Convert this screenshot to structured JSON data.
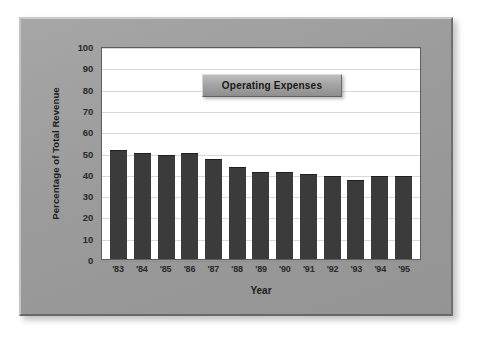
{
  "chart_data": {
    "type": "bar",
    "title": "Operating Expenses",
    "xlabel": "Year",
    "ylabel": "Percentage of Total Revenue",
    "categories": [
      "'83",
      "'84",
      "'85",
      "'86",
      "'87",
      "'88",
      "'89",
      "'90",
      "'91",
      "'92",
      "'93",
      "'94",
      "'95"
    ],
    "values": [
      51,
      50,
      49,
      50,
      47,
      43,
      41,
      41,
      40,
      39,
      37,
      39,
      39
    ],
    "series": [
      {
        "name": "Operating Expenses",
        "values": [
          51,
          50,
          49,
          50,
          47,
          43,
          41,
          41,
          40,
          39,
          37,
          39,
          39
        ]
      }
    ],
    "ylim": [
      0,
      100
    ],
    "ytick_labels": [
      "100",
      "90",
      "80",
      "70",
      "60",
      "50",
      "40",
      "30",
      "20",
      "10",
      "0"
    ],
    "ytick_values": [
      100,
      90,
      80,
      70,
      60,
      50,
      40,
      30,
      20,
      10,
      0
    ],
    "grid": true,
    "grid_axis": "y",
    "legend_position": "inside-top-center",
    "bar_color": "#3b3b3b",
    "plot_background": "#ffffff",
    "panel_background": "#9d9d9d",
    "gridline_color": "#d8d8d8"
  }
}
